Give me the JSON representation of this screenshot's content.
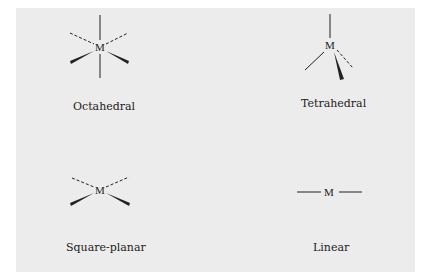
{
  "figure": {
    "background_color": "#ececec",
    "ink_color": "#222222",
    "geometries": [
      {
        "name": "Octahedral",
        "center_atom": "M",
        "bonds": [
          "plain-up",
          "plain-down",
          "dashed-upper-left",
          "dashed-upper-right",
          "wedge-lower-left",
          "wedge-lower-right"
        ]
      },
      {
        "name": "Tetrahedral",
        "center_atom": "M",
        "bonds": [
          "plain-up",
          "plain-lower-left",
          "wedge-down",
          "dashed-lower-right"
        ]
      },
      {
        "name": "Square-planar",
        "center_atom": "M",
        "bonds": [
          "dashed-upper-left",
          "dashed-upper-right",
          "wedge-lower-left",
          "wedge-lower-right"
        ]
      },
      {
        "name": "Linear",
        "center_atom": "M",
        "bonds": [
          "plain-left",
          "plain-right"
        ]
      }
    ]
  }
}
